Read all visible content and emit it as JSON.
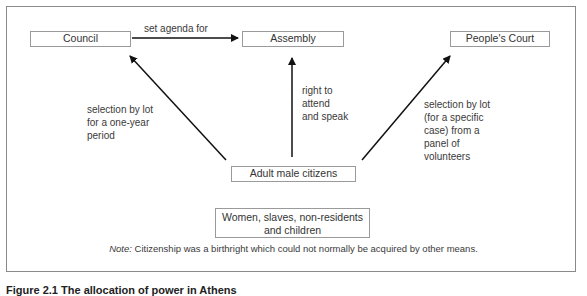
{
  "diagram": {
    "nodes": {
      "council": "Council",
      "assembly": "Assembly",
      "peoples_court": "People's Court",
      "adult_male_citizens": "Adult male citizens",
      "excluded_line1": "Women, slaves, non-residents",
      "excluded_line2": "and children"
    },
    "edges": {
      "council_to_assembly": "set agenda for",
      "citizens_to_council": [
        "selection by lot",
        "for a one-year",
        "period"
      ],
      "citizens_to_assembly": [
        "right to",
        "attend",
        "and speak"
      ],
      "citizens_to_court": [
        "selection by lot",
        "(for a specific",
        "case) from a",
        "panel of",
        "volunteers"
      ]
    },
    "note": {
      "prefix": "Note:",
      "text": " Citizenship was a birthright which could not normally be acquired by other means."
    },
    "caption": "Figure 2.1 The allocation of power in Athens"
  }
}
